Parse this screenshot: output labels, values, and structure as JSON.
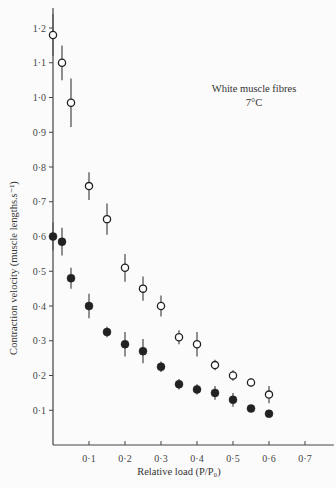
{
  "chart_data": {
    "type": "scatter",
    "title": "",
    "annotation": {
      "line1": "White muscle fibres",
      "line2": "7°C"
    },
    "xlabel": "Relative load (P/P₀)",
    "ylabel": "Contraction velocity (muscle lengths.s⁻¹)",
    "xlim": [
      0,
      0.75
    ],
    "ylim": [
      0,
      1.25
    ],
    "xticks": [
      0.1,
      0.2,
      0.3,
      0.4,
      0.5,
      0.6,
      0.7
    ],
    "xtick_labels": [
      "0·1",
      "0·2",
      "0·3",
      "0·4",
      "0·5",
      "0·6",
      "0·7"
    ],
    "yticks": [
      0.1,
      0.2,
      0.3,
      0.4,
      0.5,
      0.6,
      0.7,
      0.8,
      0.9,
      1.0,
      1.1,
      1.2
    ],
    "ytick_labels": [
      "0·1",
      "0·2",
      "0·3",
      "0·4",
      "0·5",
      "0·6",
      "0·7",
      "0·8",
      "0·9",
      "1·0",
      "1·1",
      "1·2"
    ],
    "grid": false,
    "legend": null,
    "series": [
      {
        "name": "open circles",
        "marker": "open-circle",
        "x": [
          0.0,
          0.025,
          0.05,
          0.1,
          0.15,
          0.2,
          0.25,
          0.3,
          0.35,
          0.4,
          0.45,
          0.5,
          0.55,
          0.6
        ],
        "y": [
          1.18,
          1.1,
          0.985,
          0.745,
          0.65,
          0.51,
          0.45,
          0.4,
          0.31,
          0.29,
          0.23,
          0.2,
          0.18,
          0.145
        ],
        "error": [
          0.06,
          0.05,
          0.07,
          0.04,
          0.045,
          0.04,
          0.035,
          0.03,
          0.02,
          0.035,
          0.015,
          0.015,
          0.012,
          0.025
        ]
      },
      {
        "name": "filled circles",
        "marker": "filled-circle",
        "x": [
          0.0,
          0.025,
          0.05,
          0.1,
          0.15,
          0.2,
          0.25,
          0.3,
          0.35,
          0.4,
          0.45,
          0.5,
          0.55,
          0.6
        ],
        "y": [
          0.6,
          0.585,
          0.48,
          0.4,
          0.325,
          0.29,
          0.27,
          0.225,
          0.175,
          0.16,
          0.15,
          0.13,
          0.105,
          0.09
        ],
        "error": [
          0.04,
          0.04,
          0.03,
          0.035,
          0.015,
          0.035,
          0.035,
          0.015,
          0.015,
          0.015,
          0.02,
          0.02,
          0.01,
          0.008
        ]
      }
    ]
  },
  "colors": {
    "ink": "#222222",
    "axis": "#444444",
    "background": "#fbfbfb"
  }
}
